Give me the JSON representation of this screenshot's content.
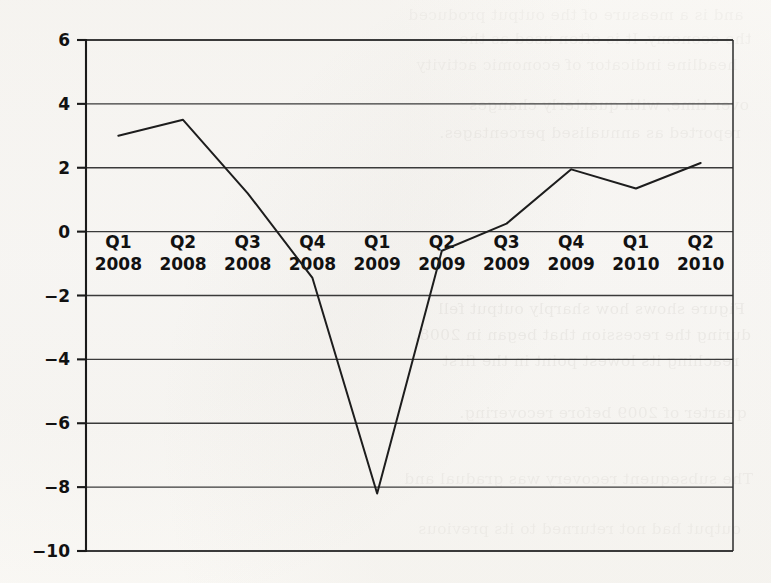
{
  "page": {
    "background_color": "#fbfaf8",
    "bleed_through_text": [
      "and is a measure of the output produced",
      "the economy. It is often used as the",
      "headline indicator of economic activity",
      "over time, with quarterly changes",
      "reported as annualised percentages.",
      "Figure shows how sharply output fell",
      "during the recession that began in 2008,",
      "reaching its lowest point in the first",
      "quarter of 2009 before recovering.",
      "The subsequent recovery was gradual and",
      "output had not returned to its previous"
    ]
  },
  "chart_data": {
    "type": "line",
    "title": "",
    "subtitle": "",
    "xlabel": "",
    "ylabel": "",
    "categories": [
      "Q1\n2008",
      "Q2\n2008",
      "Q3\n2008",
      "Q4\n2008",
      "Q1\n2009",
      "Q2\n2009",
      "Q3\n2009",
      "Q4\n2009",
      "Q1\n2010",
      "Q2\n2010"
    ],
    "category_quarters": [
      "Q1",
      "Q2",
      "Q3",
      "Q4",
      "Q1",
      "Q2",
      "Q3",
      "Q4",
      "Q1",
      "Q2"
    ],
    "category_years": [
      "2008",
      "2008",
      "2008",
      "2008",
      "2009",
      "2009",
      "2009",
      "2009",
      "2010",
      "2010"
    ],
    "values": [
      3.0,
      3.5,
      1.2,
      -1.45,
      -8.2,
      -0.6,
      0.25,
      1.95,
      1.35,
      2.15
    ],
    "ylim": [
      -10,
      6
    ],
    "yticks": [
      6,
      4,
      2,
      0,
      -2,
      -4,
      -6,
      -8,
      -10
    ],
    "ytick_labels": [
      "6",
      "4",
      "2",
      "0",
      "−2",
      "−4",
      "−6",
      "−8",
      "−10"
    ],
    "grid": true,
    "grid_axis": "y",
    "legend": false,
    "legend_position": "none",
    "line_color": "#1d1d1d",
    "grid_color": "#3a3a3a",
    "axis_color": "#1a1a1a",
    "markers": false
  },
  "plot_geometry": {
    "left": 86,
    "right": 733,
    "top": 40,
    "bottom": 551,
    "x_label_band_y": 248
  }
}
